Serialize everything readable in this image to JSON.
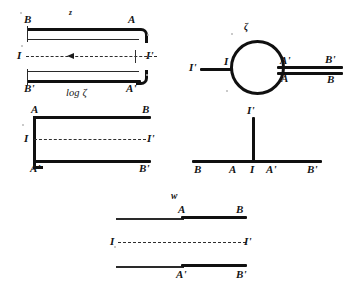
{
  "figure": {
    "caption_symbols": {
      "z_plane": "z",
      "log_zeta": "log ζ",
      "zeta_plane": "ζ",
      "w_plane": "w"
    },
    "panels": [
      {
        "id": "top-left-z-plane",
        "name": "z-plane-hairpin",
        "plane_label": "z",
        "sub_label": "log ζ",
        "labels": {
          "top_left": "B",
          "top_right": "A",
          "mid_left": "I",
          "mid_right": "I'",
          "bottom_left": "B'",
          "bottom_right": "A'"
        },
        "flow_direction": "leftward",
        "arrow_glyph": "left-arrow"
      },
      {
        "id": "mid-left-strip",
        "name": "strip-region",
        "labels": {
          "top_left": "A",
          "top_right": "B",
          "mid_left": "I",
          "mid_right": "I'",
          "bottom_left": "A'",
          "bottom_right": "B'"
        }
      },
      {
        "id": "right-circle",
        "name": "zeta-plane-circle",
        "plane_label": "ζ",
        "labels": {
          "left_outer": "I'",
          "left_inner": "I",
          "circle_top_right": "A'",
          "circle_bottom_right": "A",
          "far_top_right": "B'",
          "far_bottom_right": "B"
        }
      },
      {
        "id": "right-tee",
        "name": "zeta-plane-cut-line",
        "labels": {
          "vertical_top": "I'",
          "axis_1": "B",
          "axis_2": "A",
          "axis_3": "I",
          "axis_4": "A'",
          "axis_5": "B'"
        }
      },
      {
        "id": "bottom-w-plane",
        "name": "w-plane-slit",
        "plane_label": "w",
        "labels": {
          "upper_mid": "A",
          "upper_right": "B",
          "dash_left": "I",
          "dash_right": "I'",
          "lower_mid": "A'",
          "lower_right": "B'"
        }
      }
    ]
  }
}
